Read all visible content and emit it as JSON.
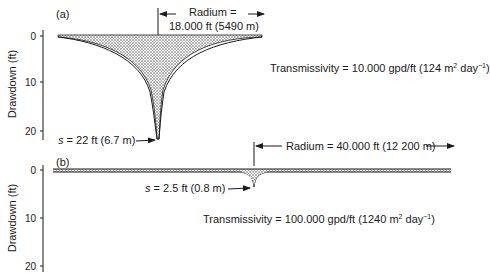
{
  "panel_a": {
    "label": "(a)",
    "y_axis_label": "Drawdown (ft)",
    "y_ticks": [
      "0",
      "10",
      "20"
    ],
    "radius_line1": "Radium =",
    "radius_line2": "18.000 ft (5490 m)",
    "transmissivity_prefix": "Transmissivity = 10.000 gpd/ft (124 m",
    "transmissivity_sup1": "2",
    "transmissivity_mid": " day",
    "transmissivity_sup2": "−1",
    "transmissivity_suffix": ")",
    "s_var": "s",
    "s_value": " = 22 ft (6.7 m)"
  },
  "panel_b": {
    "label": "(b)",
    "y_axis_label": "Drawdown (ft)",
    "y_ticks": [
      "0",
      "10",
      "20"
    ],
    "radius_text": "Radium = 40.000 ft (12 200 m)",
    "transmissivity_prefix": "Transmissivity = 100.000 gpd/ft (1240 m",
    "transmissivity_sup1": "2",
    "transmissivity_mid": " day",
    "transmissivity_sup2": "−1",
    "transmissivity_suffix": ")",
    "s_var": "s",
    "s_value": " = 2.5 ft (0.8 m)"
  },
  "colors": {
    "ink": "#1a1a1a",
    "stipple": "#555555",
    "background": "#ffffff"
  }
}
